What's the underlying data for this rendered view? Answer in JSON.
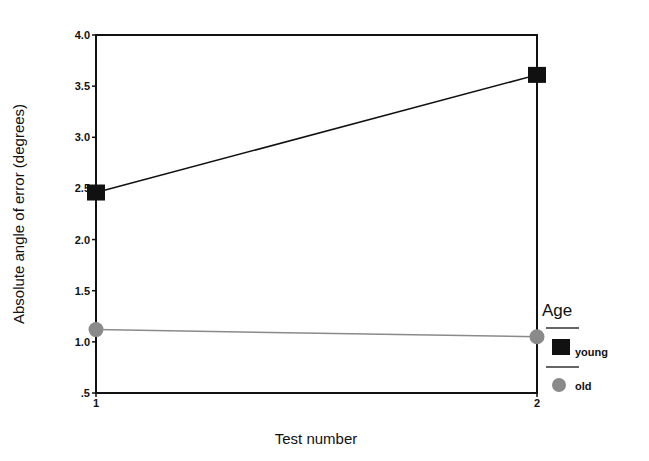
{
  "chart_data": {
    "type": "line",
    "title": "",
    "xlabel": "Test number",
    "ylabel": "Absolute angle of error (degrees)",
    "x": [
      1,
      2
    ],
    "x_tick_labels": [
      "1",
      "2"
    ],
    "y_tick_labels": [
      "4.0",
      "3.5",
      "3.0",
      "2.5",
      "2.0",
      "1.5",
      "1.0",
      ".5"
    ],
    "ylim": [
      0.5,
      4.0
    ],
    "grid": false,
    "legend": {
      "title": "Age",
      "position": "right",
      "entries": [
        {
          "label": "young",
          "marker": "square",
          "color": "#111111"
        },
        {
          "label": "old",
          "marker": "circle",
          "color": "#8a8a8a"
        }
      ]
    },
    "series": [
      {
        "name": "young",
        "values": [
          2.46,
          3.61
        ],
        "color": "#111111",
        "marker": "square"
      },
      {
        "name": "old",
        "values": [
          1.12,
          1.05
        ],
        "color": "#8a8a8a",
        "marker": "circle"
      }
    ]
  }
}
